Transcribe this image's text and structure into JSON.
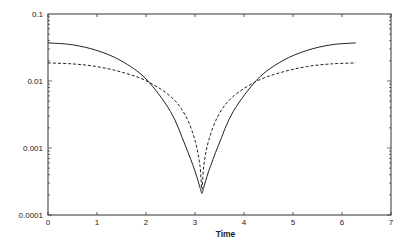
{
  "chart_data": {
    "type": "line",
    "title": "",
    "xlabel": "Time",
    "ylabel": "",
    "xlim": [
      0,
      7
    ],
    "ylim": [
      0.0001,
      0.1
    ],
    "yscale": "log",
    "grid": false,
    "legend": null,
    "x_ticks": [
      "0",
      "1",
      "2",
      "3",
      "4",
      "5",
      "6",
      "7"
    ],
    "y_ticks": [
      "0.0001",
      "0.001",
      "0.01",
      "0.1"
    ],
    "x": [
      0,
      0.5,
      1.0,
      1.5,
      2.0,
      2.5,
      2.8,
      3.0,
      3.1,
      3.1416,
      3.18,
      3.28,
      3.48,
      3.78,
      4.28,
      4.78,
      5.28,
      5.78,
      6.28
    ],
    "series": [
      {
        "name": "solid",
        "style": "solid",
        "values": [
          0.037,
          0.0347,
          0.0285,
          0.0199,
          0.0107,
          0.0035,
          0.0011,
          0.00045,
          0.00026,
          0.00021,
          0.00026,
          0.00045,
          0.0011,
          0.0035,
          0.0107,
          0.0199,
          0.0285,
          0.0347,
          0.037
        ]
      },
      {
        "name": "dashed",
        "style": "dashed",
        "values": [
          0.0186,
          0.018,
          0.0164,
          0.0136,
          0.0101,
          0.0059,
          0.0031,
          0.0013,
          0.00055,
          0.00024,
          0.00055,
          0.0013,
          0.0031,
          0.0059,
          0.0101,
          0.0136,
          0.0164,
          0.018,
          0.0186
        ]
      }
    ]
  }
}
